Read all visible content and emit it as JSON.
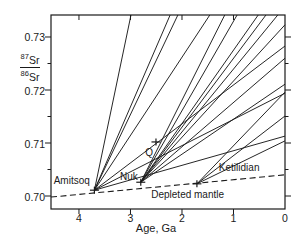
{
  "chart_data": {
    "type": "line",
    "xlabel": "Age, Ga",
    "ylabel": {
      "num_sup": "87",
      "num_base": "Sr",
      "den_sup": "86",
      "den_base": "Sr"
    },
    "x_axis": {
      "range": [
        4.543,
        0
      ],
      "direction": "reversed",
      "ticks": [
        4,
        3,
        2,
        1
      ],
      "tick_labels": [
        "4",
        "3",
        "2",
        "1",
        "0"
      ],
      "tick_label_values": [
        4,
        3,
        2,
        1,
        0
      ]
    },
    "y_axis": {
      "range": [
        0.69755,
        0.73415
      ],
      "ticks": [
        0.7,
        0.71,
        0.72,
        0.73
      ],
      "tick_labels": [
        "0.70",
        "0.71",
        "0.72",
        "0.73"
      ],
      "minor_ticks": [
        0.705,
        0.715,
        0.725
      ]
    },
    "depleted_mantle": {
      "label": "Depleted mantle",
      "line_style": "dashed",
      "points": [
        [
          4.543,
          0.6998
        ],
        [
          0,
          0.704
        ]
      ],
      "label_pos": [
        1.89,
        0.70047
      ]
    },
    "suites": [
      {
        "name": "Amitsoq",
        "age_ga": 3.7,
        "initial_ratio": 0.7011,
        "label_pos": [
          4.14,
          0.703
        ],
        "evolution_lines": [
          [
            2.99,
            0.73415
          ],
          [
            2.23,
            0.73415
          ],
          [
            2.08,
            0.73415
          ],
          [
            1.46,
            0.73415
          ],
          [
            0,
            0.7283
          ],
          [
            0,
            0.7194
          ],
          [
            0,
            0.7113
          ]
        ]
      },
      {
        "name": "Nuk",
        "age_ga": 2.8,
        "initial_ratio": 0.7026,
        "label_pos": [
          3.03,
          0.7037
        ],
        "evolution_lines": [
          [
            1.17,
            0.73415
          ],
          [
            0.93,
            0.73415
          ],
          [
            0.52,
            0.73415
          ],
          [
            0.37,
            0.73415
          ],
          [
            0.14,
            0.73415
          ],
          [
            0,
            0.7323
          ],
          [
            0,
            0.726
          ],
          [
            0,
            0.7211
          ]
        ]
      },
      {
        "name": "Ketilidian",
        "age_ga": 1.71,
        "initial_ratio": 0.7023,
        "label_pos": [
          0.89,
          0.70538
        ],
        "evolution_lines": [
          [
            0,
            0.7196
          ],
          [
            0,
            0.7151
          ],
          [
            0,
            0.7104
          ]
        ]
      }
    ],
    "q_point": {
      "label": "Q",
      "age_ga": 2.505,
      "ratio": 0.7102,
      "label_pos": [
        2.64,
        0.70821
      ]
    },
    "colors": {
      "ink": "#1a1a1a",
      "background": "#ffffff"
    }
  }
}
